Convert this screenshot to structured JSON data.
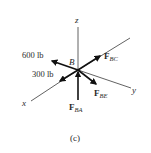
{
  "figure": {
    "caption": "(c)",
    "point_label": "B",
    "axes": {
      "x": "x",
      "y": "y",
      "z": "z"
    },
    "forces": [
      {
        "id": "600lb",
        "label": "600 lb",
        "direction": "up-left"
      },
      {
        "id": "300lb",
        "label": "300 lb",
        "direction": "down-left"
      },
      {
        "id": "FBC",
        "label_main": "F",
        "label_sub": "BC",
        "direction": "up-right"
      },
      {
        "id": "FBE",
        "label_main": "F",
        "label_sub": "BE",
        "direction": "down-right"
      },
      {
        "id": "FBA",
        "label_main": "F",
        "label_sub": "BA",
        "direction": "up (into B from below)"
      }
    ],
    "colors": {
      "ink": "#111111",
      "axis": "#3a3a3a",
      "background": "#ffffff"
    }
  }
}
